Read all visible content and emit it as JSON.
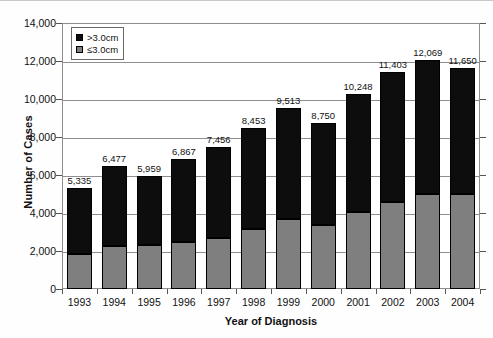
{
  "chart_data": {
    "type": "bar",
    "subtype": "stacked-vertical",
    "title": "",
    "xlabel": "Year of Diagnosis",
    "ylabel": "Number of Cases",
    "categories": [
      "1993",
      "1994",
      "1995",
      "1996",
      "1997",
      "1998",
      "1999",
      "2000",
      "2001",
      "2002",
      "2003",
      "2004"
    ],
    "series": [
      {
        "name": ">3.0cm",
        "color": "#0d0d0d",
        "values": [
          3485,
          4227,
          3659,
          4417,
          4756,
          5303,
          5813,
          5400,
          6198,
          6803,
          7069,
          6650
        ]
      },
      {
        "name": "≤3.0cm",
        "color": "#7f7f7f",
        "values": [
          1850,
          2250,
          2300,
          2450,
          2700,
          3150,
          3700,
          3350,
          4050,
          4600,
          5000,
          5000
        ]
      }
    ],
    "totals": [
      "5,335",
      "6,477",
      "5,959",
      "6,867",
      "7,456",
      "8,453",
      "9,513",
      "8,750",
      "10,248",
      "11,403",
      "12,069",
      "11,650"
    ],
    "totals_numeric": [
      5335,
      6477,
      5959,
      6867,
      7456,
      8453,
      9513,
      8750,
      10248,
      11403,
      12069,
      11650
    ],
    "ylim": [
      0,
      14000
    ],
    "ytick_labels": [
      "14,000",
      "12,000",
      "10,000",
      "8,000",
      "6,000",
      "4,000",
      "2,000",
      "0"
    ],
    "ytick_values": [
      14000,
      12000,
      10000,
      8000,
      6000,
      4000,
      2000,
      0
    ],
    "grid": "horizontal",
    "legend_position": "top-left",
    "legend": [
      {
        "label": ">3.0cm",
        "color": "#0d0d0d"
      },
      {
        "label": "≤3.0cm",
        "color": "#7f7f7f"
      }
    ]
  }
}
